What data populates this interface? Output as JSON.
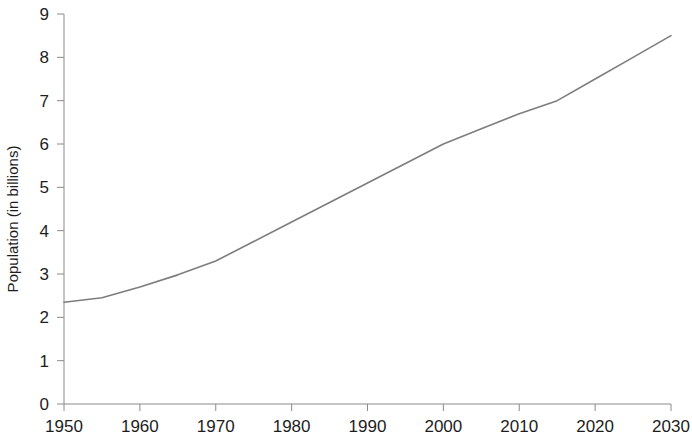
{
  "chart_data": {
    "type": "line",
    "title": "",
    "subtitle": "",
    "xlabel": "",
    "ylabel": "Population (in billions)",
    "xlim": [
      1950,
      2030
    ],
    "ylim": [
      0,
      9
    ],
    "xticks": [
      1950,
      1960,
      1970,
      1980,
      1990,
      2000,
      2010,
      2020,
      2030
    ],
    "yticks": [
      0,
      1,
      2,
      3,
      4,
      5,
      6,
      7,
      8,
      9
    ],
    "xtick_labels": [
      "1950",
      "1960",
      "1970",
      "1980",
      "1990",
      "2000",
      "2010",
      "2020",
      "2030"
    ],
    "ytick_labels": [
      "0",
      "1",
      "2",
      "3",
      "4",
      "5",
      "6",
      "7",
      "8",
      "9"
    ],
    "grid": false,
    "legend": "none",
    "series": [
      {
        "name": "World population",
        "color": "#7d7d7d",
        "line_width": 1.6,
        "x": [
          1950,
          1955,
          1960,
          1965,
          1970,
          1975,
          1980,
          1985,
          1990,
          1995,
          2000,
          2005,
          2010,
          2015,
          2020,
          2025,
          2030
        ],
        "values": [
          2.35,
          2.45,
          2.7,
          2.98,
          3.3,
          3.75,
          4.2,
          4.65,
          5.1,
          5.55,
          6.0,
          6.35,
          6.7,
          7.0,
          7.5,
          8.0,
          8.5
        ]
      }
    ],
    "annotations": []
  },
  "axes": {
    "y_axis_label": "Population (in billions)",
    "line_color": "#7d7d7d",
    "axis_color": "#8a8a8a"
  }
}
